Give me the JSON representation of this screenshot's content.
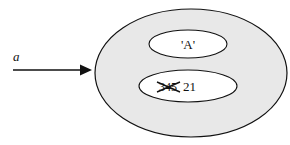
{
  "diagram": {
    "variable_label": "a",
    "outer_object": {
      "fill": "#e8e8e8",
      "stroke": "#111111"
    },
    "fields": [
      {
        "value": "'A'"
      },
      {
        "old_value_struck": "345",
        "new_value": "21"
      }
    ]
  }
}
